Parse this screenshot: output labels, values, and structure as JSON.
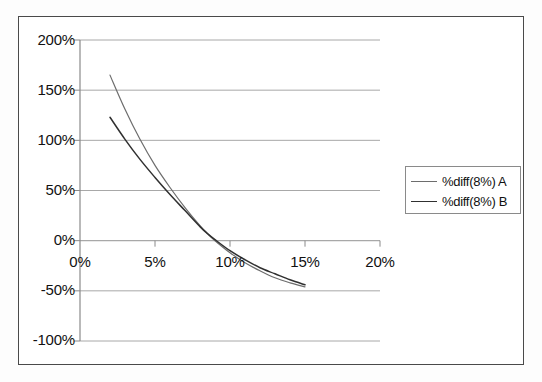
{
  "chart_data": {
    "type": "line",
    "title": "",
    "xlabel": "",
    "ylabel": "",
    "xlim": [
      0,
      20
    ],
    "ylim": [
      -100,
      200
    ],
    "grid": true,
    "legend_position": "right",
    "x_ticks": [
      "0%",
      "5%",
      "10%",
      "15%",
      "20%"
    ],
    "x_tick_values": [
      0,
      5,
      10,
      15,
      20
    ],
    "y_ticks": [
      "200%",
      "150%",
      "100%",
      "50%",
      "0%",
      "-50%",
      "-100%"
    ],
    "y_tick_values": [
      200,
      150,
      100,
      50,
      0,
      -50,
      -100
    ],
    "x": [
      2,
      3,
      4,
      5,
      6,
      7,
      8,
      8.5,
      9,
      10,
      11,
      12,
      13,
      14,
      15
    ],
    "series": [
      {
        "name": "%diff(8%) A",
        "color": "#6d6d6d",
        "values": [
          165,
          131,
          101,
          75,
          53,
          33,
          15,
          7,
          0,
          -12,
          -22,
          -30,
          -37,
          -42,
          -46
        ]
      },
      {
        "name": "%diff(8%) B",
        "color": "#303030",
        "values": [
          123,
          101,
          81,
          63,
          46,
          30,
          14,
          7,
          1,
          -10,
          -19,
          -27,
          -33,
          -39,
          -44
        ]
      }
    ]
  },
  "legend": {
    "entries": [
      {
        "label": "%diff(8%) A"
      },
      {
        "label": "%diff(8%) B"
      }
    ]
  },
  "axes": {
    "y_labels": [
      "200%",
      "150%",
      "100%",
      "50%",
      "0%",
      "-50%",
      "-100%"
    ],
    "x_labels": [
      "0%",
      "5%",
      "10%",
      "15%",
      "20%"
    ]
  },
  "colors": {
    "series_a": "#6d6d6d",
    "series_b": "#303030",
    "gridline": "#a8a8a8",
    "axis": "#8a8a8a",
    "frame": "#4a4a4a",
    "background": "#ffffff",
    "text": "#111111"
  }
}
